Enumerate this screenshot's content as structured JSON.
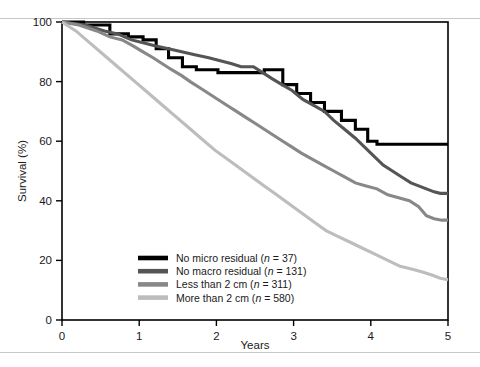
{
  "figure": {
    "background_color": "#ffffff",
    "rule_color": "#c8c8c8"
  },
  "chart_data": {
    "type": "line",
    "title": "",
    "subtitle": "",
    "xlabel": "Years",
    "ylabel": "Survival (%)",
    "xlim": [
      0,
      5
    ],
    "ylim": [
      0,
      100
    ],
    "xticks": [
      "0",
      "1",
      "2",
      "3",
      "4",
      "5"
    ],
    "yticks": [
      "0",
      "20",
      "40",
      "60",
      "80",
      "100"
    ],
    "grid": false,
    "legend_position": "bottom-left-inside",
    "curve_style": "kaplan-meier-step",
    "series": [
      {
        "name": "No micro residual",
        "n": 37,
        "legend_text": "No micro residual (n = 37)",
        "color": "#000000",
        "width": 3.1,
        "final_value": 59,
        "points": [
          [
            0.0,
            100
          ],
          [
            0.28,
            100
          ],
          [
            0.28,
            99
          ],
          [
            0.62,
            99
          ],
          [
            0.62,
            96
          ],
          [
            0.86,
            96
          ],
          [
            0.86,
            95
          ],
          [
            1.05,
            95
          ],
          [
            1.05,
            94
          ],
          [
            1.22,
            94
          ],
          [
            1.22,
            91
          ],
          [
            1.38,
            91
          ],
          [
            1.38,
            88
          ],
          [
            1.56,
            88
          ],
          [
            1.56,
            85
          ],
          [
            1.74,
            85
          ],
          [
            1.74,
            84
          ],
          [
            2.02,
            84
          ],
          [
            2.02,
            83
          ],
          [
            2.62,
            83
          ],
          [
            2.62,
            84
          ],
          [
            2.86,
            84
          ],
          [
            2.86,
            79
          ],
          [
            3.04,
            79
          ],
          [
            3.04,
            76
          ],
          [
            3.22,
            76
          ],
          [
            3.22,
            73
          ],
          [
            3.4,
            73
          ],
          [
            3.4,
            70
          ],
          [
            3.62,
            70
          ],
          [
            3.62,
            67
          ],
          [
            3.8,
            67
          ],
          [
            3.8,
            64
          ],
          [
            3.96,
            64
          ],
          [
            3.96,
            60
          ],
          [
            4.08,
            60
          ],
          [
            4.08,
            59
          ],
          [
            5.0,
            59
          ]
        ]
      },
      {
        "name": "No macro residual",
        "n": 131,
        "legend_text": "No macro residual (n = 131)",
        "color": "#555555",
        "width": 3.1,
        "final_value": 42.5,
        "points": [
          [
            0.0,
            100
          ],
          [
            0.3,
            99
          ],
          [
            0.55,
            97
          ],
          [
            0.72,
            96
          ],
          [
            0.9,
            94
          ],
          [
            1.05,
            93
          ],
          [
            1.2,
            92
          ],
          [
            1.38,
            91
          ],
          [
            1.55,
            90
          ],
          [
            1.72,
            89
          ],
          [
            1.9,
            88
          ],
          [
            2.05,
            87
          ],
          [
            2.2,
            86
          ],
          [
            2.32,
            85
          ],
          [
            2.48,
            85
          ],
          [
            2.6,
            83
          ],
          [
            2.72,
            81
          ],
          [
            2.85,
            79
          ],
          [
            2.98,
            77
          ],
          [
            3.12,
            74
          ],
          [
            3.26,
            72
          ],
          [
            3.4,
            70
          ],
          [
            3.52,
            67
          ],
          [
            3.66,
            64
          ],
          [
            3.8,
            61
          ],
          [
            3.92,
            58
          ],
          [
            4.04,
            55
          ],
          [
            4.16,
            52
          ],
          [
            4.28,
            50
          ],
          [
            4.4,
            48
          ],
          [
            4.52,
            46
          ],
          [
            4.62,
            45
          ],
          [
            4.72,
            44
          ],
          [
            4.82,
            43
          ],
          [
            4.9,
            42.5
          ],
          [
            5.0,
            42.5
          ]
        ]
      },
      {
        "name": "Less than 2 cm",
        "n": 311,
        "legend_text": "Less than 2 cm (n = 311)",
        "color": "#888888",
        "width": 3.1,
        "final_value": 33.5,
        "points": [
          [
            0.0,
            100
          ],
          [
            0.22,
            99
          ],
          [
            0.45,
            97
          ],
          [
            0.62,
            95
          ],
          [
            0.78,
            94
          ],
          [
            0.92,
            92
          ],
          [
            1.05,
            90
          ],
          [
            1.18,
            88
          ],
          [
            1.3,
            86
          ],
          [
            1.42,
            84
          ],
          [
            1.55,
            82
          ],
          [
            1.66,
            80
          ],
          [
            1.78,
            78
          ],
          [
            1.9,
            76
          ],
          [
            2.02,
            74
          ],
          [
            2.14,
            72
          ],
          [
            2.26,
            70
          ],
          [
            2.38,
            68
          ],
          [
            2.5,
            66
          ],
          [
            2.62,
            64
          ],
          [
            2.74,
            62
          ],
          [
            2.86,
            60
          ],
          [
            2.98,
            58
          ],
          [
            3.1,
            56
          ],
          [
            3.24,
            54
          ],
          [
            3.38,
            52
          ],
          [
            3.52,
            50
          ],
          [
            3.66,
            48
          ],
          [
            3.8,
            46
          ],
          [
            3.94,
            45
          ],
          [
            4.08,
            44
          ],
          [
            4.22,
            42
          ],
          [
            4.36,
            41
          ],
          [
            4.5,
            40
          ],
          [
            4.62,
            38
          ],
          [
            4.72,
            35
          ],
          [
            4.82,
            34
          ],
          [
            4.92,
            33.5
          ],
          [
            5.0,
            33.5
          ]
        ]
      },
      {
        "name": "More than 2 cm",
        "n": 580,
        "legend_text": "More than 2 cm (n = 580)",
        "color": "#bdbdbd",
        "width": 3.1,
        "final_value": 13.5,
        "points": [
          [
            0.0,
            100
          ],
          [
            0.18,
            97
          ],
          [
            0.36,
            93
          ],
          [
            0.54,
            89
          ],
          [
            0.72,
            85
          ],
          [
            0.9,
            81
          ],
          [
            1.08,
            77
          ],
          [
            1.26,
            73
          ],
          [
            1.44,
            69
          ],
          [
            1.62,
            65
          ],
          [
            1.8,
            61
          ],
          [
            1.98,
            57
          ],
          [
            2.14,
            54
          ],
          [
            2.3,
            51
          ],
          [
            2.46,
            48
          ],
          [
            2.62,
            45
          ],
          [
            2.78,
            42
          ],
          [
            2.94,
            39
          ],
          [
            3.1,
            36
          ],
          [
            3.26,
            33
          ],
          [
            3.42,
            30
          ],
          [
            3.58,
            28
          ],
          [
            3.74,
            26
          ],
          [
            3.9,
            24
          ],
          [
            4.06,
            22
          ],
          [
            4.22,
            20
          ],
          [
            4.38,
            18
          ],
          [
            4.54,
            17
          ],
          [
            4.68,
            16
          ],
          [
            4.8,
            15
          ],
          [
            4.9,
            14
          ],
          [
            5.0,
            13.5
          ]
        ]
      }
    ]
  }
}
